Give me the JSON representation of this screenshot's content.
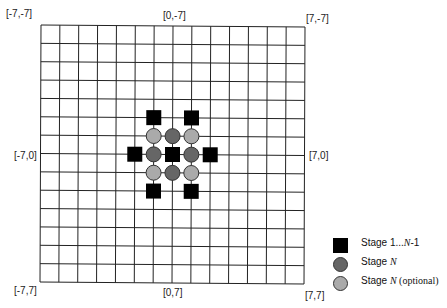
{
  "diagram": {
    "grid": {
      "cells_x": 14,
      "cells_y": 14,
      "min": -7,
      "max": 7,
      "line_color": "#222222",
      "corners_px": {
        "top_left": [
          41,
          25
        ],
        "top_right": [
          305,
          27
        ],
        "bottom_left": [
          40,
          282
        ],
        "bottom_right": [
          304,
          284
        ]
      }
    },
    "coordinate_labels": [
      {
        "id": "top-left",
        "text": "[-7,-7]",
        "x": 6,
        "y": 8
      },
      {
        "id": "top-center",
        "text": "[0,-7]",
        "x": 163,
        "y": 10
      },
      {
        "id": "top-right",
        "text": "[7,-7]",
        "x": 306,
        "y": 13
      },
      {
        "id": "middle-left",
        "text": "[-7,0]",
        "x": 14,
        "y": 150
      },
      {
        "id": "middle-right",
        "text": "[7,0]",
        "x": 309,
        "y": 150
      },
      {
        "id": "bottom-left",
        "text": "[-7,7]",
        "x": 14,
        "y": 285
      },
      {
        "id": "bottom-center",
        "text": "[0,7]",
        "x": 163,
        "y": 287
      },
      {
        "id": "bottom-right",
        "text": "[7,7]",
        "x": 305,
        "y": 290
      }
    ],
    "markers": {
      "stage_1_to_n_minus_1": {
        "shape": "square",
        "color": "#000000",
        "points": [
          [
            0,
            0
          ],
          [
            -1,
            -2
          ],
          [
            1,
            -2
          ],
          [
            -2,
            0
          ],
          [
            2,
            0
          ],
          [
            -1,
            2
          ],
          [
            1,
            2
          ]
        ]
      },
      "stage_n": {
        "shape": "circle",
        "color": "#666666",
        "points": [
          [
            0,
            -1
          ],
          [
            -1,
            0
          ],
          [
            1,
            0
          ],
          [
            0,
            1
          ]
        ]
      },
      "stage_n_optional": {
        "shape": "circle",
        "color": "#aaaaaa",
        "points": [
          [
            -1,
            -1
          ],
          [
            1,
            -1
          ],
          [
            -1,
            1
          ],
          [
            1,
            1
          ]
        ]
      }
    },
    "legend": {
      "items": [
        {
          "shape": "square",
          "color": "#000000",
          "prefix": "Stage 1...",
          "italic": "N",
          "suffix": "-1"
        },
        {
          "shape": "circle",
          "color": "#666666",
          "prefix": "Stage ",
          "italic": "N",
          "suffix": ""
        },
        {
          "shape": "circle",
          "color": "#aaaaaa",
          "prefix": "Stage ",
          "italic": "N",
          "suffix": " (optional)"
        }
      ]
    }
  }
}
